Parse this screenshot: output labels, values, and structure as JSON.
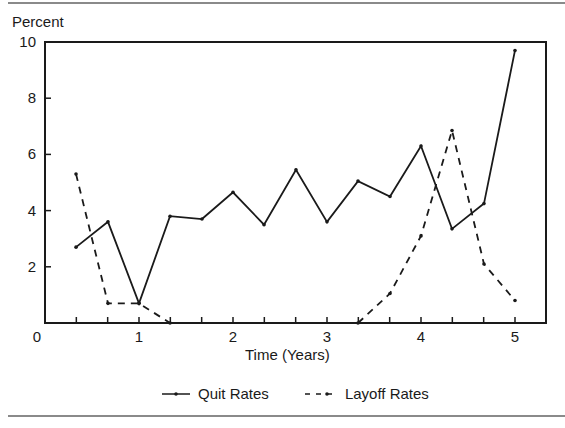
{
  "chart_data": {
    "type": "line",
    "title": "",
    "ylabel": "Percent",
    "xlabel": "Time (Years)",
    "ylim": [
      0,
      10
    ],
    "xlim": [
      0,
      5.33
    ],
    "grid": false,
    "legend_position": "bottom",
    "y_ticks": [
      "2",
      "4",
      "6",
      "8",
      "10"
    ],
    "x_ticks": [
      "0",
      "1",
      "2",
      "3",
      "4",
      "5"
    ],
    "x": [
      0.33,
      0.67,
      1.0,
      1.33,
      1.67,
      2.0,
      2.33,
      2.67,
      3.0,
      3.33,
      3.67,
      4.0,
      4.33,
      4.67,
      5.0
    ],
    "series": [
      {
        "name": "Quit Rates",
        "style": "solid",
        "values": [
          2.7,
          3.6,
          0.7,
          3.8,
          3.7,
          4.65,
          3.5,
          5.45,
          3.6,
          5.05,
          4.5,
          6.3,
          3.35,
          4.25,
          9.7
        ]
      },
      {
        "name": "Layoff Rates",
        "style": "dashed",
        "values": [
          5.3,
          0.7,
          0.7,
          0.0,
          null,
          null,
          null,
          null,
          null,
          0.0,
          1.05,
          3.1,
          6.85,
          2.1,
          0.8
        ]
      }
    ]
  },
  "labels": {
    "ylabel": "Percent",
    "xlabel": "Time (Years)",
    "origin": "0",
    "legend_quit": "Quit Rates",
    "legend_layoff": "Layoff Rates"
  }
}
